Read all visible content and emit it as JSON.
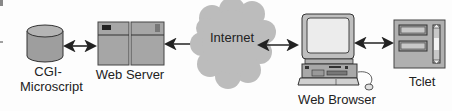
{
  "diagram": {
    "nodes": [
      {
        "id": "cgi",
        "label_line1": "CGI-",
        "label_line2": "Microscript",
        "icon": "database-cylinder-icon"
      },
      {
        "id": "webserver",
        "label": "Web Server",
        "icon": "server-icon"
      },
      {
        "id": "internet",
        "label": "Internet",
        "icon": "cloud-icon"
      },
      {
        "id": "browser",
        "label": "Web Browser",
        "icon": "desktop-computer-icon"
      },
      {
        "id": "tclet",
        "label": "Tclet",
        "icon": "applet-window-icon"
      }
    ],
    "edges": [
      {
        "from": "cgi",
        "to": "webserver",
        "direction": "bidirectional"
      },
      {
        "from": "webserver",
        "to": "internet",
        "direction": "bidirectional"
      },
      {
        "from": "internet",
        "to": "browser",
        "direction": "bidirectional"
      },
      {
        "from": "browser",
        "to": "tclet",
        "direction": "bidirectional"
      }
    ],
    "colors": {
      "fill": "#a9a9a9",
      "fill_light": "#c8c8c8",
      "cloud": "#bdbdbd",
      "stroke": "#333333",
      "background": "#fdfdfd"
    }
  }
}
